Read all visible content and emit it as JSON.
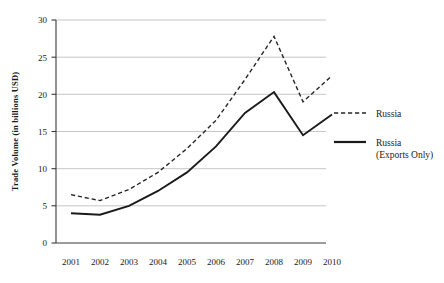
{
  "chart_data": {
    "type": "line",
    "title": "",
    "xlabel": "",
    "ylabel": "Trade Volume (in billions USD)",
    "categories": [
      "2001",
      "2002",
      "2003",
      "2004",
      "2005",
      "2006",
      "2007",
      "2008",
      "2009",
      "2010"
    ],
    "x": [
      2001,
      2002,
      2003,
      2004,
      2005,
      2006,
      2007,
      2008,
      2009,
      2010
    ],
    "xlim": [
      2001,
      2010
    ],
    "ylim": [
      0,
      30
    ],
    "yticks": [
      0,
      5,
      10,
      15,
      20,
      25,
      30
    ],
    "ytick_labels": [
      "0",
      "5",
      "10",
      "15",
      "20",
      "25",
      "30"
    ],
    "grid": "horizontal",
    "legend_position": "right",
    "series": [
      {
        "name": "Russia",
        "style": "dashed",
        "color": "#262626",
        "values": [
          6.5,
          5.7,
          7.2,
          9.5,
          12.7,
          16.5,
          22.0,
          27.8,
          19.0,
          22.5
        ]
      },
      {
        "name": "Russia (Exports Only)",
        "style": "solid",
        "color": "#1a1a1a",
        "values": [
          4.0,
          3.8,
          5.0,
          7.0,
          9.5,
          13.0,
          17.5,
          20.3,
          14.5,
          17.3
        ]
      }
    ]
  },
  "legend": {
    "entries": [
      {
        "label": "Russia",
        "label_line2": "",
        "style": "dashed"
      },
      {
        "label": "Russia",
        "label_line2": "(Exports Only)",
        "style": "solid"
      }
    ]
  },
  "axes": {
    "y_axis_title": "Trade Volume (in billions USD)",
    "y_tick_0": "0",
    "y_tick_1": "5",
    "y_tick_2": "10",
    "y_tick_3": "15",
    "y_tick_4": "20",
    "y_tick_5": "25",
    "y_tick_6": "30",
    "x_tick_0": "2001",
    "x_tick_1": "2002",
    "x_tick_2": "2003",
    "x_tick_3": "2004",
    "x_tick_4": "2005",
    "x_tick_5": "2006",
    "x_tick_6": "2007",
    "x_tick_7": "2008",
    "x_tick_8": "2009",
    "x_tick_9": "2010"
  }
}
